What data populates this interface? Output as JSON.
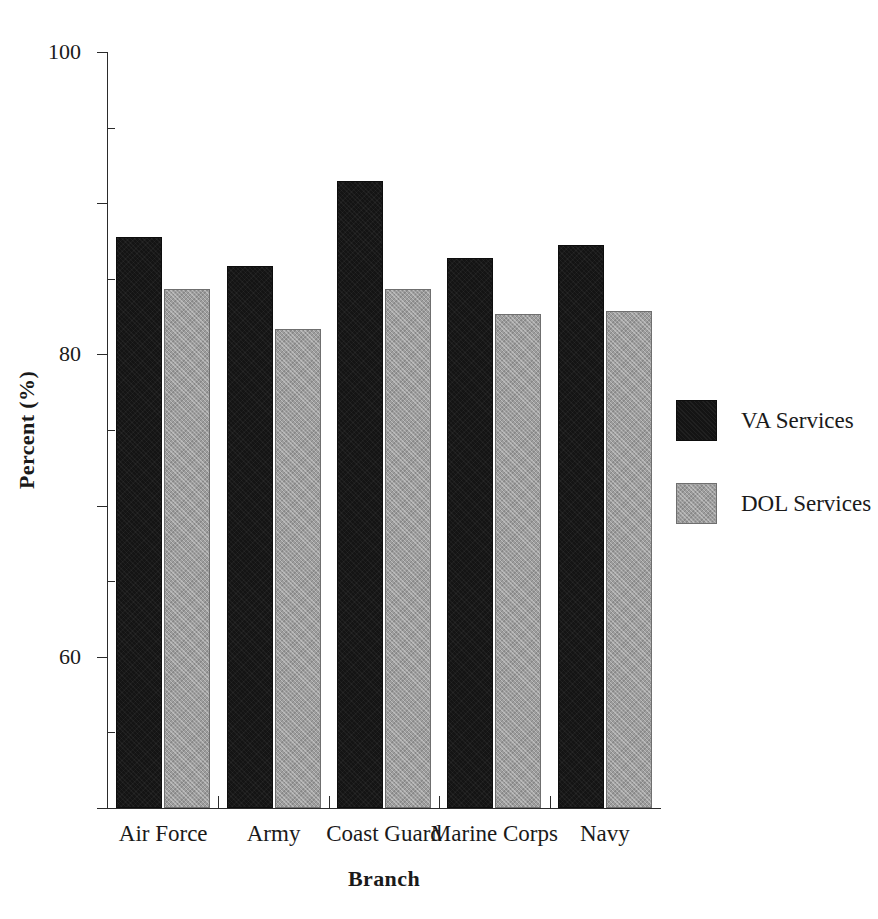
{
  "chart_data": {
    "type": "bar",
    "title": "",
    "subtitle": "",
    "xlabel": "Branch",
    "ylabel": "Percent (%)",
    "categories": [
      "Air Force",
      "Army",
      "Coast Guard",
      "Marine Corps",
      "Navy"
    ],
    "series": [
      {
        "name": "VA Services",
        "color": "#141414",
        "values": [
          75.5,
          71.7,
          82.9,
          72.7,
          74.5
        ]
      },
      {
        "name": "DOL Services",
        "color": "#9d9d9d",
        "values": [
          68.6,
          63.3,
          68.7,
          65.3,
          65.8
        ]
      }
    ],
    "ylim": [
      0,
      100
    ],
    "y_major_ticks": [
      0,
      20,
      40,
      60,
      80,
      100
    ],
    "y_tick_labels": [
      "0",
      "20",
      "40",
      "60",
      "80",
      "100"
    ],
    "y_minor_ticks": [
      10,
      30,
      50,
      70,
      90
    ],
    "grid": false,
    "legend_position": "right",
    "legend_entries": [
      "VA Services",
      "DOL Services"
    ]
  }
}
